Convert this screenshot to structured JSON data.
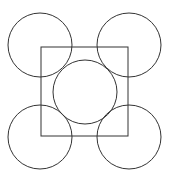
{
  "diagram": {
    "stroke_color": "#333333",
    "background": "#ffffff",
    "square": {
      "x": 41,
      "y": 47,
      "width": 87,
      "height": 89
    },
    "circles": [
      {
        "name": "top-left",
        "cx": 40,
        "cy": 45,
        "r": 32
      },
      {
        "name": "top-right",
        "cx": 129,
        "cy": 45,
        "r": 32
      },
      {
        "name": "center",
        "cx": 85,
        "cy": 92,
        "r": 32
      },
      {
        "name": "bottom-left",
        "cx": 40,
        "cy": 137,
        "r": 32
      },
      {
        "name": "bottom-right",
        "cx": 129,
        "cy": 137,
        "r": 32
      }
    ]
  }
}
